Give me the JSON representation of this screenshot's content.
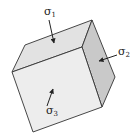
{
  "diagram": {
    "colors": {
      "front_face": "#ededed",
      "top_face": "#e2e2e2",
      "right_face": "#c9c9c9",
      "edge": "#333333",
      "arrow": "#222222"
    },
    "labels": {
      "sigma1": {
        "symbol": "σ",
        "subscript": "1"
      },
      "sigma2": {
        "symbol": "σ",
        "subscript": "2"
      },
      "sigma3": {
        "symbol": "σ",
        "subscript": "3"
      }
    }
  }
}
